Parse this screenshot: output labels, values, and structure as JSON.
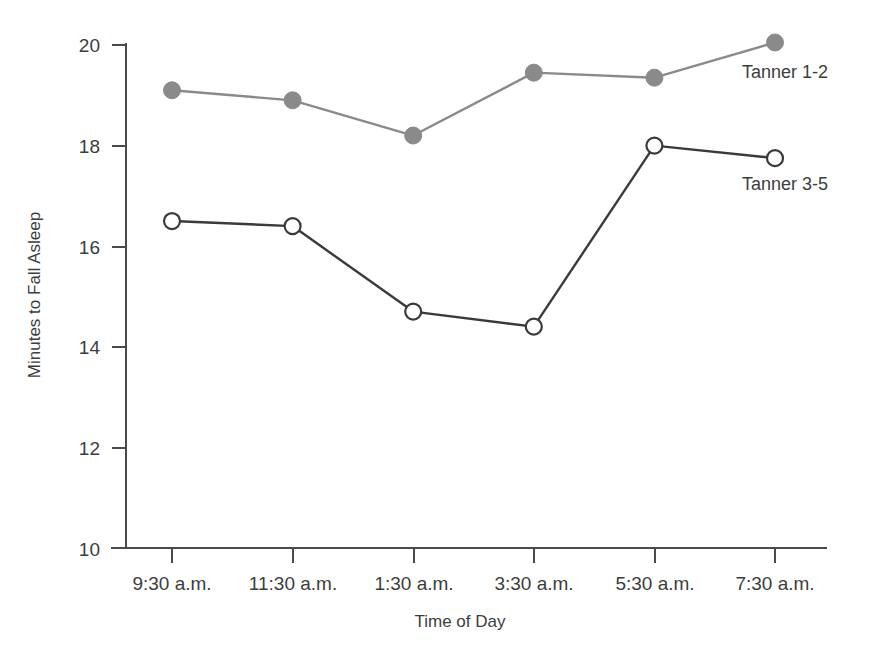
{
  "chart_data": {
    "type": "line",
    "title": "",
    "xlabel": "Time of Day",
    "ylabel": "Minutes to Fall Asleep",
    "categories": [
      "9:30 a.m.",
      "11:30 a.m.",
      "1:30 a.m.",
      "3:30 a.m.",
      "5:30 a.m.",
      "7:30 a.m."
    ],
    "ylim": [
      10,
      20
    ],
    "yticks": [
      10,
      12,
      14,
      16,
      18,
      20
    ],
    "ytick_labels": [
      "10",
      "12",
      "14",
      "16",
      "18",
      "20"
    ],
    "grid": false,
    "legend_position": "inline-right",
    "series": [
      {
        "name": "Tanner 1-2",
        "marker": "filled-circle",
        "color": "#8a8a8a",
        "values": [
          19.1,
          18.9,
          18.2,
          19.45,
          19.35,
          20.05
        ]
      },
      {
        "name": "Tanner 3-5",
        "marker": "open-circle",
        "color": "#3a3a3a",
        "values": [
          16.5,
          16.4,
          14.7,
          14.4,
          18.0,
          17.75
        ]
      }
    ],
    "annotations": [
      {
        "text": "Tanner 1-2",
        "series": 0
      },
      {
        "text": "Tanner 3-5",
        "series": 1
      }
    ]
  },
  "colors": {
    "background": "#ffffff",
    "axis": "#4a4a4a",
    "text": "#3d3d3d",
    "series_tanner_1_2": "#8a8a8a",
    "series_tanner_3_5": "#3a3a3a",
    "marker_fill_open": "#ffffff"
  }
}
